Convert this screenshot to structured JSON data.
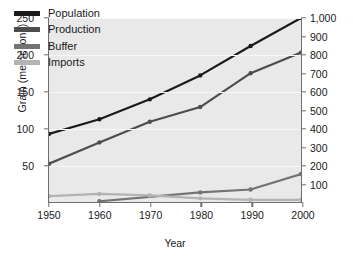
{
  "chart_data": {
    "type": "line",
    "title": "",
    "xlabel": "Year",
    "ylabel": "Grain (metric tons)",
    "ylabel_right": "Population (millions)",
    "x": [
      1950,
      1960,
      1970,
      1980,
      1990,
      2000
    ],
    "xticklabels": [
      "1950",
      "1960",
      "1970",
      "1980",
      "1990",
      "2000"
    ],
    "xlim": [
      1950,
      2000
    ],
    "ylim": [
      0,
      250
    ],
    "yticks": [
      50,
      100,
      150,
      200,
      250
    ],
    "yticklabels": [
      "50",
      "100",
      "150",
      "200",
      "250"
    ],
    "ylim_right": [
      0,
      1000
    ],
    "yticks_right": [
      100,
      200,
      300,
      400,
      500,
      600,
      700,
      800,
      900,
      1000
    ],
    "yticklabels_right": [
      "100",
      "200",
      "300",
      "400",
      "500",
      "600",
      "700",
      "800",
      "900",
      "1,000"
    ],
    "grid": true,
    "legend_position": "upper left",
    "series": [
      {
        "name": "Population",
        "axis": "right",
        "color": "#1a1a1a",
        "x": [
          1950,
          1960,
          1970,
          1980,
          1990,
          2000
        ],
        "values": [
          370,
          450,
          558,
          688,
          848,
          1000
        ]
      },
      {
        "name": "Production",
        "axis": "left",
        "color": "#4d4d4d",
        "x": [
          1950,
          1960,
          1970,
          1980,
          1990,
          2000
        ],
        "values": [
          52,
          81,
          109,
          129,
          175,
          203
        ]
      },
      {
        "name": "Buffer",
        "axis": "left",
        "color": "#737373",
        "x": [
          1960,
          1980,
          1990,
          2000
        ],
        "values": [
          1,
          13,
          17,
          38
        ]
      },
      {
        "name": "Imports",
        "axis": "left",
        "color": "#b3b3b3",
        "x": [
          1950,
          1960,
          1970,
          1980,
          1990,
          2000
        ],
        "values": [
          8,
          11,
          9,
          5,
          3,
          3
        ]
      }
    ]
  },
  "legend": {
    "items": [
      {
        "label": "Population",
        "color": "#1a1a1a"
      },
      {
        "label": "Production",
        "color": "#4d4d4d"
      },
      {
        "label": "Buffer",
        "color": "#737373"
      },
      {
        "label": "Imports",
        "color": "#b3b3b3"
      }
    ]
  },
  "colors": {
    "panel_background": "#e9e9e9",
    "gridline": "#f6f6f6",
    "axis": "#6e6e6e",
    "text": "#1a1a1a",
    "page_background": "#ffffff"
  }
}
